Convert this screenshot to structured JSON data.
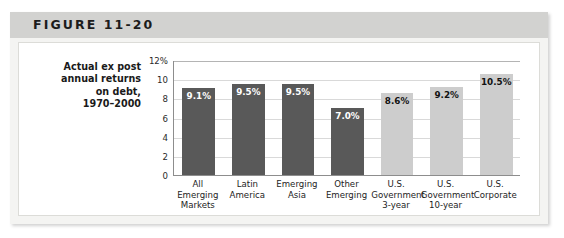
{
  "figure": {
    "title": "FIGURE 11-20",
    "header_bg": "#d2d2d0",
    "panel_bg": "#f4f4f2"
  },
  "chart_data": {
    "type": "bar",
    "title": "FIGURE 11-20",
    "caption": "Actual ex post annual returns on debt, 1970–2000",
    "caption_lines": [
      "Actual ex post",
      "annual returns",
      "on debt,",
      "1970–2000"
    ],
    "categories": [
      "All Emerging Markets",
      "Latin America",
      "Emerging Asia",
      "Other Emerging",
      "U.S. Government 3-year",
      "U.S. Government 10-year",
      "U.S. Corporate"
    ],
    "category_lines": [
      [
        "All Emerging",
        "Markets"
      ],
      [
        "Latin",
        "America"
      ],
      [
        "Emerging",
        "Asia"
      ],
      [
        "Other",
        "Emerging"
      ],
      [
        "U.S.",
        "Government",
        "3-year"
      ],
      [
        "U.S.",
        "Government",
        "10-year"
      ],
      [
        "U.S.",
        "Corporate"
      ]
    ],
    "values": [
      9.1,
      9.5,
      9.5,
      7.0,
      8.6,
      9.2,
      10.5
    ],
    "value_labels": [
      "9.1%",
      "9.5%",
      "9.5%",
      "7.0%",
      "8.6%",
      "9.2%",
      "10.5%"
    ],
    "bar_colors": [
      "#595959",
      "#595959",
      "#595959",
      "#595959",
      "#cdcdcd",
      "#cdcdcd",
      "#cdcdcd"
    ],
    "xlabel": "",
    "ylabel": "",
    "ylim": [
      0,
      12
    ],
    "yticks": [
      0,
      2,
      4,
      6,
      8,
      10,
      12
    ],
    "ytick_labels": [
      "0",
      "2",
      "4",
      "6",
      "8",
      "10",
      "12%"
    ],
    "grid": true,
    "legend": "none"
  }
}
